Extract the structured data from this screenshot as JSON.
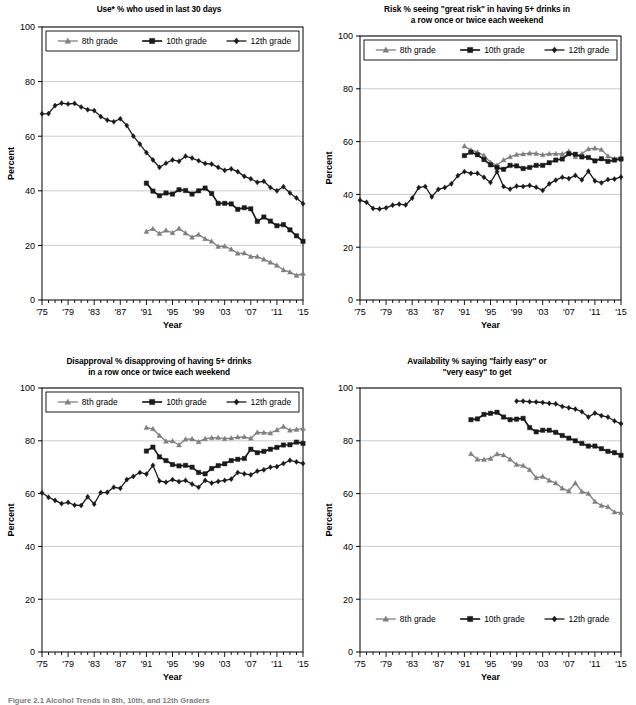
{
  "figure": {
    "caption": "Figure 2.1  Alcohol Trends in 8th, 10th, and 12th Graders",
    "series_names": [
      "8th grade",
      "10th grade",
      "12th grade"
    ],
    "colors": {
      "grade8": "#7f7f7f",
      "grade10": "#1a1a1a",
      "grade12": "#1a1a1a",
      "axis": "#000000",
      "grid": "#bfbfbf",
      "background": "#ffffff"
    },
    "markers": {
      "grade8": "triangle",
      "grade10": "square",
      "grade12": "diamond"
    }
  },
  "chart_data": [
    {
      "id": "use",
      "type": "line",
      "title": "Use* % who used in last 30 days",
      "title_lines": [
        "Use* % who used in last 30 days"
      ],
      "xlabel": "Year",
      "ylabel": "Percent",
      "ylim": [
        0,
        100
      ],
      "yticks": [
        0,
        20,
        40,
        60,
        80,
        100
      ],
      "xlim": [
        1975,
        2015
      ],
      "xticks": [
        "'75",
        "'79",
        "'83",
        "'87",
        "'91",
        "'95",
        "'99",
        "'03",
        "'07",
        "'11",
        "'15"
      ],
      "grid": true,
      "legend_position": "top-inside-boxed",
      "series": [
        {
          "name": "8th grade",
          "x": [
            1991,
            1992,
            1993,
            1994,
            1995,
            1996,
            1997,
            1998,
            1999,
            2000,
            2001,
            2002,
            2003,
            2004,
            2005,
            2006,
            2007,
            2008,
            2009,
            2010,
            2011,
            2012,
            2013,
            2014,
            2015
          ],
          "values": [
            25.1,
            26.1,
            24.3,
            25.5,
            24.6,
            26.2,
            24.5,
            23.0,
            24.0,
            22.4,
            21.5,
            19.6,
            19.7,
            18.6,
            17.1,
            17.2,
            15.9,
            15.9,
            14.9,
            13.8,
            12.7,
            11.0,
            10.2,
            9.0,
            9.7
          ]
        },
        {
          "name": "10th grade",
          "x": [
            1991,
            1992,
            1993,
            1994,
            1995,
            1996,
            1997,
            1998,
            1999,
            2000,
            2001,
            2002,
            2003,
            2004,
            2005,
            2006,
            2007,
            2008,
            2009,
            2010,
            2011,
            2012,
            2013,
            2014,
            2015
          ],
          "values": [
            42.8,
            39.9,
            38.2,
            39.2,
            38.8,
            40.4,
            40.1,
            38.8,
            40.0,
            41.0,
            39.0,
            35.4,
            35.4,
            35.2,
            33.2,
            33.8,
            33.4,
            28.8,
            30.4,
            28.9,
            27.2,
            27.6,
            25.7,
            23.5,
            21.5
          ]
        },
        {
          "name": "12th grade",
          "x": [
            1975,
            1976,
            1977,
            1978,
            1979,
            1980,
            1981,
            1982,
            1983,
            1984,
            1985,
            1986,
            1987,
            1988,
            1989,
            1990,
            1991,
            1992,
            1993,
            1994,
            1995,
            1996,
            1997,
            1998,
            1999,
            2000,
            2001,
            2002,
            2003,
            2004,
            2005,
            2006,
            2007,
            2008,
            2009,
            2010,
            2011,
            2012,
            2013,
            2014,
            2015
          ],
          "values": [
            68.2,
            68.3,
            71.2,
            72.1,
            71.8,
            72.0,
            70.7,
            69.7,
            69.4,
            67.2,
            65.9,
            65.3,
            66.4,
            63.9,
            60.0,
            57.1,
            54.0,
            51.3,
            48.6,
            50.1,
            51.3,
            50.8,
            52.7,
            52.0,
            51.0,
            50.0,
            49.8,
            48.6,
            47.5,
            48.0,
            47.0,
            45.3,
            44.4,
            43.1,
            43.5,
            41.2,
            40.0,
            41.5,
            39.2,
            37.4,
            35.3
          ]
        }
      ]
    },
    {
      "id": "risk",
      "type": "line",
      "title": "Risk % seeing \"great risk\" in having 5+ drinks in a row once or twice each weekend",
      "title_lines": [
        "Risk % seeing \"great risk\" in having 5+ drinks in",
        "a row once or twice each weekend"
      ],
      "xlabel": "Year",
      "ylabel": "Percent",
      "ylim": [
        0,
        100
      ],
      "yticks": [
        0,
        20,
        40,
        60,
        80,
        100
      ],
      "xlim": [
        1975,
        2015
      ],
      "xticks": [
        "'75",
        "'79",
        "'83",
        "'87",
        "'91",
        "'95",
        "'99",
        "'03",
        "'07",
        "'11",
        "'15"
      ],
      "grid": true,
      "legend_position": "top-inside-boxed",
      "series": [
        {
          "name": "8th grade",
          "x": [
            1991,
            1992,
            1993,
            1994,
            1995,
            1996,
            1997,
            1998,
            1999,
            2000,
            2001,
            2002,
            2003,
            2004,
            2005,
            2006,
            2007,
            2008,
            2009,
            2010,
            2011,
            2012,
            2013,
            2014,
            2015
          ],
          "values": [
            58.3,
            56.8,
            56.0,
            54.7,
            52.1,
            51.0,
            53.0,
            54.2,
            55.1,
            55.3,
            55.6,
            55.5,
            55.0,
            55.4,
            55.4,
            55.3,
            56.3,
            54.2,
            55.4,
            57.2,
            57.5,
            57.0,
            54.5,
            53.5,
            54.0
          ]
        },
        {
          "name": "10th grade",
          "x": [
            1991,
            1992,
            1993,
            1994,
            1995,
            1996,
            1997,
            1998,
            1999,
            2000,
            2001,
            2002,
            2003,
            2004,
            2005,
            2006,
            2007,
            2008,
            2009,
            2010,
            2011,
            2012,
            2013,
            2014,
            2015
          ],
          "values": [
            54.7,
            56.0,
            55.0,
            53.2,
            51.2,
            50.2,
            49.5,
            51.0,
            50.8,
            49.8,
            50.2,
            51.0,
            51.0,
            52.0,
            53.0,
            53.4,
            55.4,
            55.2,
            54.2,
            54.0,
            52.7,
            53.5,
            52.5,
            53.0,
            53.4
          ]
        },
        {
          "name": "12th grade",
          "x": [
            1975,
            1976,
            1977,
            1978,
            1979,
            1980,
            1981,
            1982,
            1983,
            1984,
            1985,
            1986,
            1987,
            1988,
            1989,
            1990,
            1991,
            1992,
            1993,
            1994,
            1995,
            1996,
            1997,
            1998,
            1999,
            2000,
            2001,
            2002,
            2003,
            2004,
            2005,
            2006,
            2007,
            2008,
            2009,
            2010,
            2011,
            2012,
            2013,
            2014,
            2015
          ],
          "values": [
            37.8,
            37.0,
            34.7,
            34.5,
            34.9,
            35.9,
            36.3,
            36.0,
            38.6,
            42.6,
            43.0,
            39.1,
            41.9,
            42.6,
            44.0,
            47.1,
            48.6,
            48.0,
            48.0,
            46.5,
            44.5,
            48.6,
            43.0,
            42.0,
            43.1,
            43.0,
            43.4,
            42.7,
            41.5,
            44.0,
            45.4,
            46.5,
            46.0,
            47.2,
            45.5,
            48.8,
            45.1,
            44.4,
            45.6,
            45.8,
            46.6
          ]
        }
      ]
    },
    {
      "id": "disapproval",
      "type": "line",
      "title": "Disapproval % disapproving of having 5+ drinks in a row once or twice each weekend",
      "title_lines": [
        "Disapproval % disapproving of having 5+ drinks",
        "in a row once or twice each weekend"
      ],
      "xlabel": "Year",
      "ylabel": "Percent",
      "ylim": [
        0,
        100
      ],
      "yticks": [
        0,
        20,
        40,
        60,
        80,
        100
      ],
      "xlim": [
        1975,
        2015
      ],
      "xticks": [
        "'75",
        "'79",
        "'83",
        "'87",
        "'91",
        "'95",
        "'99",
        "'03",
        "'07",
        "'11",
        "'15"
      ],
      "grid": true,
      "legend_position": "top-inside-boxed",
      "series": [
        {
          "name": "8th grade",
          "x": [
            1991,
            1992,
            1993,
            1994,
            1995,
            1996,
            1997,
            1998,
            1999,
            2000,
            2001,
            2002,
            2003,
            2004,
            2005,
            2006,
            2007,
            2008,
            2009,
            2010,
            2011,
            2012,
            2013,
            2014,
            2015
          ],
          "values": [
            85.0,
            84.5,
            82.0,
            79.8,
            79.9,
            78.4,
            80.6,
            80.7,
            79.6,
            80.8,
            81.1,
            81.2,
            80.8,
            81.0,
            81.4,
            81.5,
            80.9,
            83.2,
            83.1,
            82.9,
            84.1,
            85.4,
            84.0,
            84.3,
            84.6
          ]
        },
        {
          "name": "10th grade",
          "x": [
            1991,
            1992,
            1993,
            1994,
            1995,
            1996,
            1997,
            1998,
            1999,
            2000,
            2001,
            2002,
            2003,
            2004,
            2005,
            2006,
            2007,
            2008,
            2009,
            2010,
            2011,
            2012,
            2013,
            2014,
            2015
          ],
          "values": [
            76.1,
            77.6,
            73.9,
            72.5,
            71.0,
            70.5,
            70.7,
            70.0,
            68.0,
            67.5,
            69.5,
            70.6,
            71.3,
            72.5,
            73.0,
            73.3,
            76.8,
            75.5,
            76.0,
            76.8,
            77.5,
            78.4,
            78.5,
            79.5,
            79.0
          ]
        },
        {
          "name": "12th grade",
          "x": [
            1975,
            1976,
            1977,
            1978,
            1979,
            1980,
            1981,
            1982,
            1983,
            1984,
            1985,
            1986,
            1987,
            1988,
            1989,
            1990,
            1991,
            1992,
            1993,
            1994,
            1995,
            1996,
            1997,
            1998,
            1999,
            2000,
            2001,
            2002,
            2003,
            2004,
            2005,
            2006,
            2007,
            2008,
            2009,
            2010,
            2011,
            2012,
            2013,
            2014,
            2015
          ],
          "values": [
            60.3,
            58.6,
            57.4,
            56.2,
            56.7,
            55.6,
            55.5,
            58.8,
            56.0,
            60.4,
            60.5,
            62.4,
            62.0,
            65.3,
            66.5,
            68.0,
            67.4,
            70.7,
            64.8,
            64.3,
            65.3,
            64.5,
            65.0,
            63.6,
            62.4,
            65.0,
            64.0,
            64.6,
            65.0,
            65.5,
            68.0,
            67.5,
            67.1,
            68.5,
            69.0,
            70.0,
            70.2,
            71.4,
            72.6,
            72.0,
            71.4
          ]
        }
      ]
    },
    {
      "id": "availability",
      "type": "line",
      "title": "Availability % saying \"fairly easy\" or \"very easy\" to get",
      "title_lines": [
        "Availability % saying \"fairly easy\" or",
        "\"very easy\" to get"
      ],
      "xlabel": "Year",
      "ylabel": "Percent",
      "ylim": [
        0,
        100
      ],
      "yticks": [
        0,
        20,
        40,
        60,
        80,
        100
      ],
      "xlim": [
        1975,
        2015
      ],
      "xticks": [
        "'75",
        "'79",
        "'83",
        "'87",
        "'91",
        "'95",
        "'99",
        "'03",
        "'07",
        "'11",
        "'15"
      ],
      "grid": true,
      "legend_position": "bottom-inside",
      "series": [
        {
          "name": "8th grade",
          "x": [
            1992,
            1993,
            1994,
            1995,
            1996,
            1997,
            1998,
            1999,
            2000,
            2001,
            2002,
            2003,
            2004,
            2005,
            2006,
            2007,
            2008,
            2009,
            2010,
            2011,
            2012,
            2013,
            2014,
            2015
          ],
          "values": [
            75.1,
            73.0,
            72.9,
            73.3,
            75.0,
            74.6,
            73.0,
            71.0,
            70.6,
            69.0,
            66.0,
            66.5,
            65.0,
            64.0,
            62.0,
            61.0,
            64.0,
            60.8,
            60.0,
            57.0,
            55.5,
            55.0,
            53.0,
            52.8
          ]
        },
        {
          "name": "10th grade",
          "x": [
            1992,
            1993,
            1994,
            1995,
            1996,
            1997,
            1998,
            1999,
            2000,
            2001,
            2002,
            2003,
            2004,
            2005,
            2006,
            2007,
            2008,
            2009,
            2010,
            2011,
            2012,
            2013,
            2014,
            2015
          ],
          "values": [
            88.0,
            88.3,
            90.0,
            90.4,
            90.8,
            89.0,
            88.0,
            88.2,
            88.5,
            85.0,
            83.4,
            84.0,
            84.0,
            83.2,
            82.0,
            81.0,
            80.0,
            79.0,
            78.0,
            78.0,
            77.0,
            76.0,
            75.5,
            74.5
          ]
        },
        {
          "name": "12th grade",
          "x": [
            1999,
            2000,
            2001,
            2002,
            2003,
            2004,
            2005,
            2006,
            2007,
            2008,
            2009,
            2010,
            2011,
            2012,
            2013,
            2014,
            2015
          ],
          "values": [
            95.0,
            95.0,
            94.8,
            94.7,
            94.5,
            94.2,
            94.0,
            93.0,
            92.5,
            92.0,
            91.0,
            89.0,
            90.5,
            89.5,
            89.0,
            87.5,
            86.5
          ]
        }
      ]
    }
  ]
}
